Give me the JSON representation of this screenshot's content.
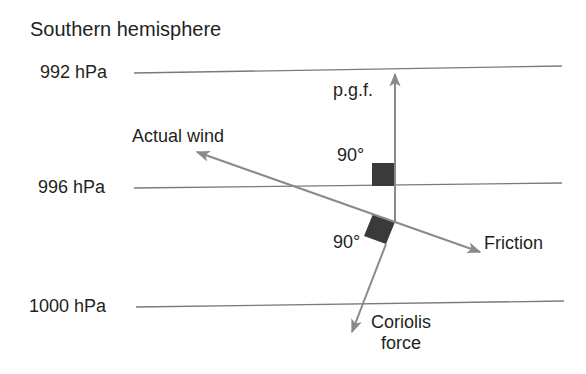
{
  "title": "Southern hemisphere",
  "isobars": [
    {
      "label": "992 hPa"
    },
    {
      "label": "996 hPa"
    },
    {
      "label": "1000 hPa"
    }
  ],
  "vectors": {
    "pgf": {
      "label": "p.g.f."
    },
    "actual_wind": {
      "label": "Actual wind"
    },
    "friction": {
      "label": "Friction"
    },
    "coriolis": {
      "label_line1": "Coriolis",
      "label_line2": "force"
    }
  },
  "angles": [
    {
      "label": "90°",
      "between": "p.g.f. and isobar"
    },
    {
      "label": "90°",
      "between": "Coriolis force and actual wind"
    }
  ],
  "colors": {
    "isobar_line": "#7a7a7a",
    "arrow": "#8a8a8a",
    "right_angle_marker": "#3a3a3a",
    "text": "#231f20"
  }
}
